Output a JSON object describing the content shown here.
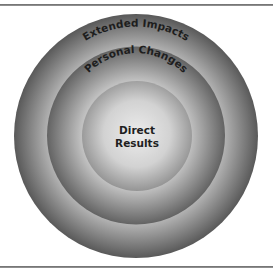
{
  "diagram": {
    "type": "concentric-circles",
    "rings": [
      {
        "id": "outer",
        "label": "Extended Impacts",
        "color_edge": "#5c5c5c",
        "color_inner": "#b8b8b8"
      },
      {
        "id": "middle",
        "label": "Personal Changes",
        "color_edge": "#666666",
        "color_inner": "#c4c4c4"
      },
      {
        "id": "center",
        "label_line1": "Direct",
        "label_line2": "Results",
        "color_edge": "#8a8a8a",
        "color_inner": "#e2e2e2"
      }
    ],
    "frame_color": "#7a7a7a"
  }
}
